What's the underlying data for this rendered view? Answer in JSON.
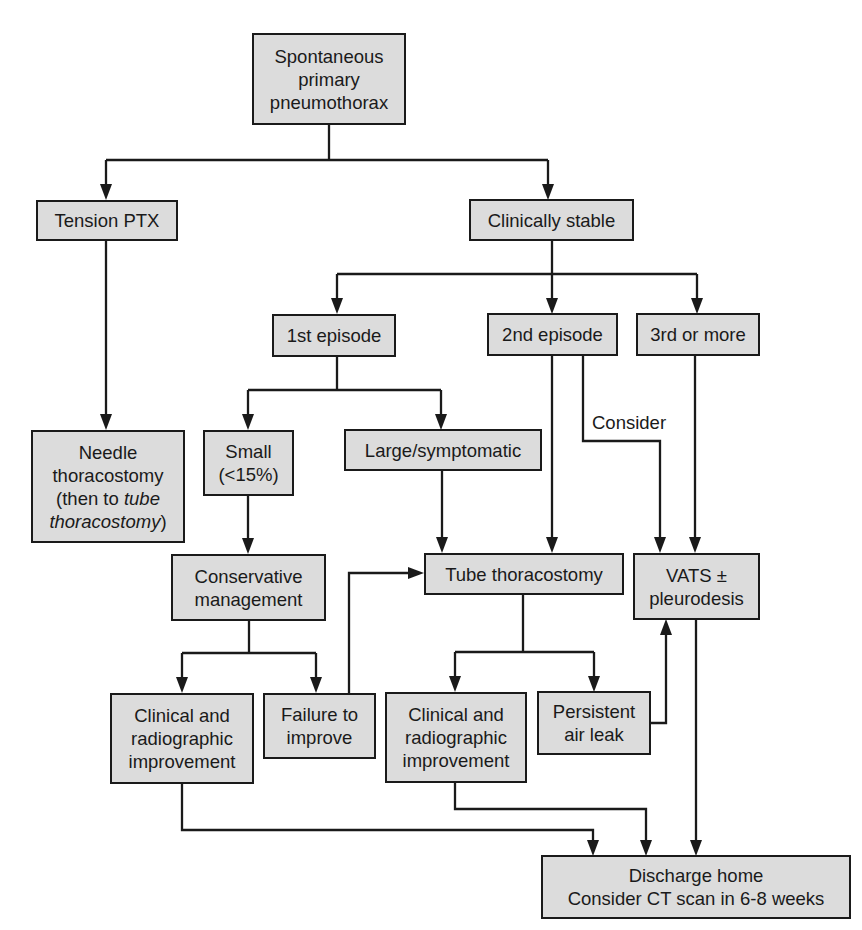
{
  "diagram": {
    "type": "flowchart",
    "colors": {
      "box_fill": "#dcdcdc",
      "box_border": "#1a1a1a",
      "line": "#1a1a1a",
      "background": "#ffffff"
    },
    "nodes": {
      "root": {
        "lines": [
          "Spontaneous",
          "primary",
          "pneumothorax"
        ]
      },
      "tension": {
        "lines": [
          "Tension PTX"
        ]
      },
      "stable": {
        "lines": [
          "Clinically stable"
        ]
      },
      "first": {
        "lines": [
          "1st episode"
        ]
      },
      "second": {
        "lines": [
          "2nd episode"
        ]
      },
      "third": {
        "lines": [
          "3rd or more"
        ]
      },
      "needle": {
        "lines": [
          "Needle",
          "thoracostomy",
          "(then to ",
          "tube",
          "thoracostomy",
          ")"
        ]
      },
      "small": {
        "lines": [
          "Small",
          "(<15%)"
        ]
      },
      "large": {
        "lines": [
          "Large/symptomatic"
        ]
      },
      "conservative": {
        "lines": [
          "Conservative",
          "management"
        ]
      },
      "tube": {
        "lines": [
          "Tube thoracostomy"
        ]
      },
      "vats": {
        "lines": [
          "VATS ±",
          "pleurodesis"
        ]
      },
      "improve_left": {
        "lines": [
          "Clinical and",
          "radiographic",
          "improvement"
        ]
      },
      "failure": {
        "lines": [
          "Failure to",
          "improve"
        ]
      },
      "improve_right": {
        "lines": [
          "Clinical and",
          "radiographic",
          "improvement"
        ]
      },
      "airleak": {
        "lines": [
          "Persistent",
          "air leak"
        ]
      },
      "discharge": {
        "lines": [
          "Discharge home",
          "Consider CT scan in 6-8 weeks"
        ]
      }
    },
    "edge_labels": {
      "consider": "Consider"
    },
    "edges": [
      [
        "root",
        "tension"
      ],
      [
        "root",
        "stable"
      ],
      [
        "tension",
        "needle"
      ],
      [
        "stable",
        "first"
      ],
      [
        "stable",
        "second"
      ],
      [
        "stable",
        "third"
      ],
      [
        "first",
        "small"
      ],
      [
        "first",
        "large"
      ],
      [
        "second",
        "tube"
      ],
      [
        "second",
        "vats",
        "Consider"
      ],
      [
        "third",
        "vats"
      ],
      [
        "small",
        "conservative"
      ],
      [
        "large",
        "tube"
      ],
      [
        "conservative",
        "improve_left"
      ],
      [
        "conservative",
        "failure"
      ],
      [
        "failure",
        "tube"
      ],
      [
        "tube",
        "improve_right"
      ],
      [
        "tube",
        "airleak"
      ],
      [
        "airleak",
        "vats"
      ],
      [
        "improve_left",
        "discharge"
      ],
      [
        "improve_right",
        "discharge"
      ],
      [
        "vats",
        "discharge"
      ]
    ]
  }
}
